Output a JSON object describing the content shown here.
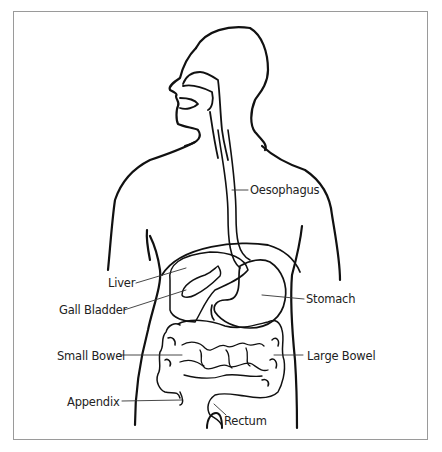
{
  "diagram": {
    "labels": {
      "oesophagus": "Oesophagus",
      "liver": "Liver",
      "gall_bladder": "Gall Bladder",
      "stomach": "Stomach",
      "small_bowel": "Small Bowel",
      "large_bowel": "Large Bowel",
      "appendix": "Appendix",
      "rectum": "Rectum"
    },
    "colors": {
      "line": "#111111",
      "frame": "#9a9a9a",
      "background": "#ffffff",
      "text": "#222222"
    }
  }
}
